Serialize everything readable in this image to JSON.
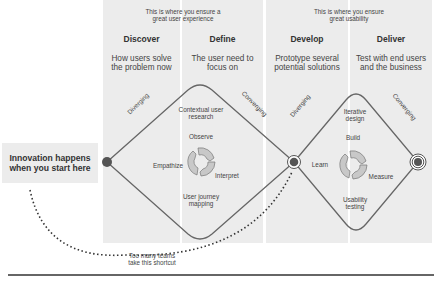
{
  "banners": {
    "left": [
      "This is where you ensure a",
      "great user experience"
    ],
    "right": [
      "This is where you ensure",
      "great usability"
    ]
  },
  "phases": [
    {
      "name": "Discover",
      "description": [
        "How users solve",
        "the problem now"
      ]
    },
    {
      "name": "Define",
      "description": [
        "The user need to",
        "focus on"
      ]
    },
    {
      "name": "Develop",
      "description": [
        "Prototype several",
        "potential solutions"
      ]
    },
    {
      "name": "Deliver",
      "description": [
        "Test with end users",
        "and the business"
      ]
    }
  ],
  "diamond1": {
    "diverging": "Diverging",
    "converging": "Converging",
    "top_activity": [
      "Contextual user",
      "research"
    ],
    "bottom_activity": [
      "User journey",
      "mapping"
    ],
    "cycle": {
      "top": "Observe",
      "left": "Empathize",
      "right": "Interpret"
    }
  },
  "diamond2": {
    "diverging": "Diverging",
    "converging": "Converging",
    "top_activity": [
      "Iterative",
      "design"
    ],
    "bottom_activity": [
      "Usability",
      "testing"
    ],
    "cycle": {
      "top": "Build",
      "left": "Learn",
      "right": "Measure"
    }
  },
  "start": {
    "line1": "Innovation happens",
    "line2": "when you start here"
  },
  "shortcut": {
    "line1": "Too many teams",
    "line2": "take this shortcut"
  },
  "colors": {
    "panel": "#ececec",
    "line": "#666666",
    "node": "#555555",
    "cycle_fill": "#c8c8c8"
  }
}
